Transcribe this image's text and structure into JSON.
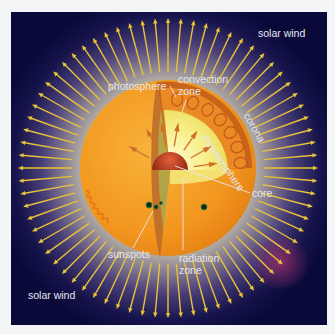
{
  "diagram": {
    "colors": {
      "background": "#0a0a3a",
      "corona_inner": "#b8b8a0",
      "corona_mid": "#6a5a80",
      "sun_surface": "#f2961e",
      "convection_zone": "#e07818",
      "radiation_zone": "#f5e86a",
      "core": "#b83a1a",
      "arrow": "#e8c23a",
      "label_text": "#e6e6ee",
      "sunspot": "#0c2a18"
    },
    "labels": {
      "solar_wind_top": "solar wind",
      "solar_wind_bottom": "solar wind",
      "photosphere": "photosphere",
      "convection_zone_line1": "convection",
      "convection_zone_line2": "zone",
      "chromosphere": "chromosphere",
      "corona": "corona",
      "core": "core",
      "sunspots": "sunspots",
      "radiation_zone_line1": "radiation",
      "radiation_zone_line2": "zone"
    },
    "solar_wind_arrows": {
      "count": 72,
      "inner_radius": 96,
      "outer_radius": 150
    }
  }
}
